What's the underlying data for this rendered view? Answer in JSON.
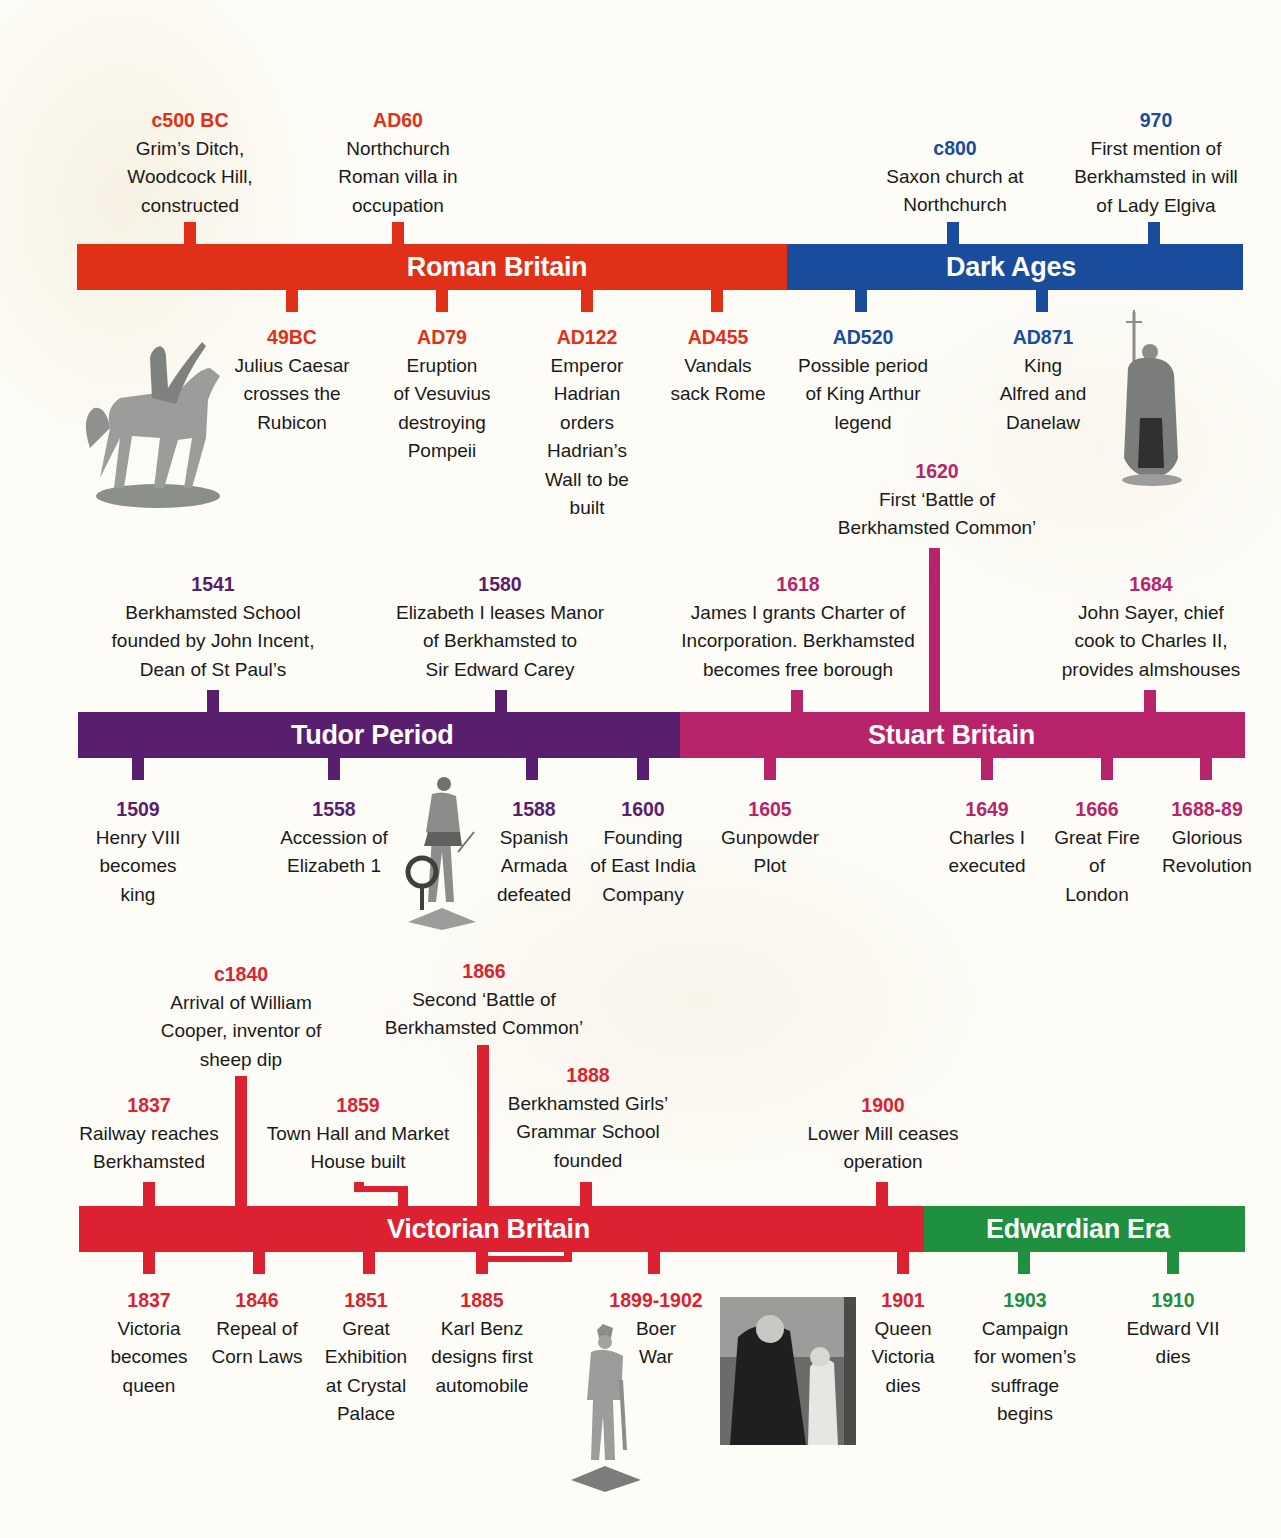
{
  "colors": {
    "roman": "#e03018",
    "dark_ages": "#1a4c9c",
    "tudor": "#5a1e6e",
    "stuart": "#b8246a",
    "victorian": "#dc2230",
    "edwardian": "#1e9040"
  },
  "periods": [
    {
      "id": "roman",
      "label": "Roman Britain"
    },
    {
      "id": "dark_ages",
      "label": "Dark Ages"
    },
    {
      "id": "tudor",
      "label": "Tudor Period"
    },
    {
      "id": "stuart",
      "label": "Stuart Britain"
    },
    {
      "id": "victorian",
      "label": "Victorian Britain"
    },
    {
      "id": "edwardian",
      "label": "Edwardian Era"
    }
  ],
  "events": {
    "roman_above": [
      {
        "year": "c500 BC",
        "text": "Grim’s Ditch,\nWoodcock Hill,\nconstructed"
      },
      {
        "year": "AD60",
        "text": "Northchurch\nRoman villa in\noccupation"
      }
    ],
    "roman_below": [
      {
        "year": "49BC",
        "text": "Julius Caesar\ncrosses the\nRubicon"
      },
      {
        "year": "AD79",
        "text": "Eruption\nof Vesuvius\ndestroying\nPompeii"
      },
      {
        "year": "AD122",
        "text": "Emperor\nHadrian\norders\nHadrian’s\nWall to be\nbuilt"
      },
      {
        "year": "AD455",
        "text": "Vandals\nsack Rome"
      }
    ],
    "dark_above": [
      {
        "year": "c800",
        "text": "Saxon church at\nNorthchurch"
      },
      {
        "year": "970",
        "text": "First mention of\nBerkhamsted in will\nof Lady Elgiva"
      }
    ],
    "dark_below": [
      {
        "year": "AD520",
        "text": "Possible period\nof King Arthur\nlegend"
      },
      {
        "year": "AD871",
        "text": "King\nAlfred and\nDanelaw"
      }
    ],
    "tudor_above": [
      {
        "year": "1541",
        "text": "Berkhamsted School\nfounded by John Incent,\nDean of St Paul’s"
      },
      {
        "year": "1580",
        "text": "Elizabeth I leases Manor\nof Berkhamsted to\nSir Edward Carey"
      }
    ],
    "tudor_below": [
      {
        "year": "1509",
        "text": "Henry VIII\nbecomes\nking"
      },
      {
        "year": "1558",
        "text": "Accession of\nElizabeth 1"
      },
      {
        "year": "1588",
        "text": "Spanish\nArmada\ndefeated"
      },
      {
        "year": "1600",
        "text": "Founding\nof East India\nCompany"
      }
    ],
    "stuart_above": [
      {
        "year": "1620",
        "text": "First ‘Battle of\nBerkhamsted Common’"
      },
      {
        "year": "1618",
        "text": "James I grants Charter of\nIncorporation. Berkhamsted\nbecomes free borough"
      },
      {
        "year": "1684",
        "text": "John Sayer, chief\ncook to Charles II,\nprovides almshouses"
      }
    ],
    "stuart_below": [
      {
        "year": "1605",
        "text": "Gunpowder\nPlot"
      },
      {
        "year": "1649",
        "text": "Charles I\nexecuted"
      },
      {
        "year": "1666",
        "text": "Great Fire\nof\nLondon"
      },
      {
        "year": "1688-89",
        "text": "Glorious\nRevolution"
      }
    ],
    "victorian_above": [
      {
        "year": "c1840",
        "text": "Arrival of William\nCooper, inventor of\nsheep dip"
      },
      {
        "year": "1866",
        "text": "Second ‘Battle of\nBerkhamsted Common’"
      },
      {
        "year": "1837",
        "text": "Railway reaches\nBerkhamsted"
      },
      {
        "year": "1859",
        "text": "Town Hall and Market\nHouse built"
      },
      {
        "year": "1888",
        "text": "Berkhamsted Girls’\nGrammar School\nfounded"
      },
      {
        "year": "1900",
        "text": "Lower Mill ceases\noperation"
      }
    ],
    "victorian_below": [
      {
        "year": "1837",
        "text": "Victoria\nbecomes\nqueen"
      },
      {
        "year": "1846",
        "text": "Repeal of\nCorn Laws"
      },
      {
        "year": "1851",
        "text": "Great\nExhibition\nat Crystal\nPalace"
      },
      {
        "year": "1885",
        "text": "Karl Benz\ndesigns first\nautomobile"
      },
      {
        "year": "1899-1902",
        "text": "Boer\nWar"
      },
      {
        "year": "1901",
        "text": "Queen\nVictoria\ndies"
      }
    ],
    "edwardian_below": [
      {
        "year": "1903",
        "text": "Campaign\nfor women’s\nsuffrage\nbegins"
      },
      {
        "year": "1910",
        "text": "Edward VII\ndies"
      }
    ]
  },
  "images": [
    {
      "name": "julius-caesar-statue-image"
    },
    {
      "name": "king-alfred-statue-image"
    },
    {
      "name": "walter-raleigh-statue-image"
    },
    {
      "name": "boer-war-soldier-statue-image"
    },
    {
      "name": "queen-victoria-photo-image"
    }
  ]
}
